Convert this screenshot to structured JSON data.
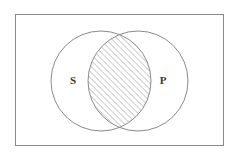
{
  "figure": {
    "type": "venn-diagram",
    "title": "",
    "background_color": "#ffffff",
    "width": 238,
    "height": 159
  },
  "universe_rectangle": {
    "name": "universal-set-box",
    "x": 15,
    "y": 14,
    "width": 209,
    "height": 132,
    "stroke_color": "#8a8a8a",
    "stroke_width": 1,
    "fill": "none",
    "label": ""
  },
  "circles": [
    {
      "id": "set-s",
      "label": "S",
      "cx": 101,
      "cy": 81,
      "r": 50,
      "stroke_color": "#8a8a8a",
      "stroke_width": 1,
      "fill": "none",
      "label_x": 73,
      "label_y": 81
    },
    {
      "id": "set-p",
      "label": "P",
      "cx": 138,
      "cy": 81,
      "r": 50,
      "stroke_color": "#8a8a8a",
      "stroke_width": 1,
      "fill": "none",
      "label_x": 163,
      "label_y": 81
    }
  ],
  "intersection": {
    "id": "s-and-p",
    "shaded": true,
    "hatch_pattern": "diagonal-lines-45-up",
    "hatch_spacing_px": 3,
    "hatch_color": "#6e6e6e",
    "hatch_stroke_width": 0.7,
    "label": ""
  },
  "labels": {
    "left_set": "S",
    "right_set": "P",
    "text_color": "#3a3a3a",
    "font_size_px": 11
  },
  "chart_data": {
    "type": "venn",
    "title": "",
    "sets": [
      "S",
      "P"
    ],
    "regions": [
      {
        "region": "S only",
        "shaded": false
      },
      {
        "region": "S ∩ P",
        "shaded": true
      },
      {
        "region": "P only",
        "shaded": false
      },
      {
        "region": "outside (universe)",
        "shaded": false
      }
    ],
    "shaded_regions": [
      "S ∩ P"
    ],
    "annotations": [
      "S",
      "P"
    ]
  }
}
